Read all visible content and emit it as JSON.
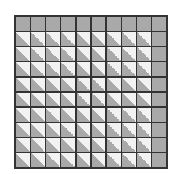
{
  "diagram": {
    "type": "grid",
    "rows": 10,
    "cols": 10,
    "colors": {
      "solid": "#a9a9a9",
      "light": "#f2f2f2",
      "border": "#333333"
    },
    "solid_rows": [
      0
    ],
    "solid_cols": [
      9
    ]
  }
}
